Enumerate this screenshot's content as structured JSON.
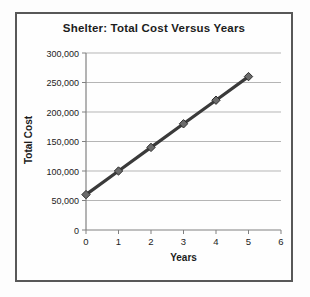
{
  "chart_data": {
    "type": "line",
    "title": "Shelter: Total Cost Versus Years",
    "xlabel": "Years",
    "ylabel": "Total Cost",
    "x": [
      0,
      1,
      2,
      3,
      4,
      5
    ],
    "values": [
      60000,
      100000,
      140000,
      180000,
      220000,
      260000
    ],
    "xlim": [
      0,
      6
    ],
    "ylim": [
      0,
      300000
    ],
    "x_ticks": [
      0,
      1,
      2,
      3,
      4,
      5,
      6
    ],
    "x_tick_labels": [
      "0",
      "1",
      "2",
      "3",
      "4",
      "5",
      "6"
    ],
    "y_ticks": [
      0,
      50000,
      100000,
      150000,
      200000,
      250000,
      300000
    ],
    "y_tick_labels": [
      "0",
      "50,000",
      "100,000",
      "150,000",
      "200,000",
      "250,000",
      "300,000"
    ],
    "grid": "horizontal",
    "legend": "none",
    "marker": "diamond",
    "colors": {
      "line": "#3a3a3a",
      "marker_fill": "#6b6b6b",
      "marker_stroke": "#2e2e2e",
      "gridline": "#b5b5b5",
      "axis": "#808080",
      "frame_border": "#585858",
      "text": "#1c1c1c"
    }
  }
}
